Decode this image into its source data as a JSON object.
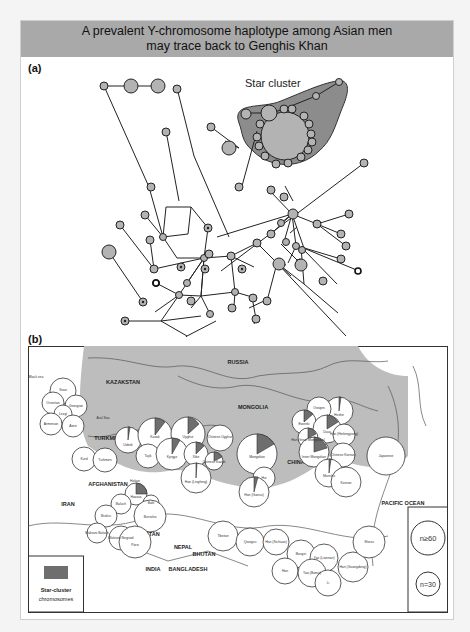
{
  "header": {
    "line1": "A prevalent Y-chromosome haplotype among Asian men",
    "line2": "may trace back to Genghis Khan"
  },
  "panel_a": {
    "label": "(a)",
    "star_cluster_label": "Star cluster",
    "colors": {
      "node_fill": "#b3b3b3",
      "cluster_fill": "#8c8c8c",
      "line": "#222222"
    }
  },
  "panel_b": {
    "label": "(b)",
    "countries": [
      "RUSSIA",
      "KAZAKSTAN",
      "MONGOLIA",
      "TURKMENISTAN",
      "AFGHANISTAN",
      "IRAN",
      "PAKISTAN",
      "NEPAL",
      "BHUTAN",
      "BANGLADESH",
      "INDIA",
      "CHINA",
      "PACIFIC OCEAN"
    ],
    "populations": [
      "Black sea",
      "Svan",
      "Ossetian",
      "Georgian",
      "Lezgi",
      "Armenian",
      "Azeri",
      "Aral Sea",
      "Kurd",
      "Turkmen",
      "Uzbek",
      "Kazak",
      "Uyghur",
      "Tajik",
      "Kyrgyz",
      "Xibe",
      "Chinese Uyghur",
      "Chinese Kazak",
      "Han (Lingfeng)",
      "Mongolian",
      "Hezhe",
      "Oroqen",
      "Ewenki",
      "Daur",
      "Han (Heilongjiang)",
      "Han (Inner Mongolian)",
      "Inner Mongolian",
      "Chinese Korean",
      "Manchu",
      "Korean",
      "Japanese",
      "Hazara",
      "Hakan",
      "Balti",
      "Burusho",
      "Baluch",
      "Brahui",
      "Makrani Baluch",
      "Makrani Negroid",
      "Parsi",
      "Hui",
      "Han (Gansu)",
      "Tibetan",
      "Qiangzu",
      "Han (Sichuan)",
      "Bouyei",
      "Yao (Liannan)",
      "Yao (Bama)",
      "Han",
      "Li",
      "Han (Guangdong)",
      "Shezu"
    ],
    "legend": {
      "swatch_label": "Star-cluster chromosomes",
      "size_large": "n≥60",
      "size_small": "n=30"
    },
    "colors": {
      "land_shading": "#bdbdbd",
      "pie_slice": "#6e6e6e",
      "border": "#333333"
    }
  }
}
